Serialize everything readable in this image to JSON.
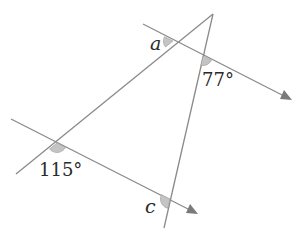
{
  "diagram": {
    "type": "geometry-angles",
    "colors": {
      "line": "#8a8a8a",
      "arc_fill": "#c4c4c4",
      "text": "#2a2a2a",
      "arrow": "#7a7a7a"
    },
    "labels": {
      "angle_a": "a",
      "angle_77": "77°",
      "angle_115": "115°",
      "angle_c": "c"
    }
  }
}
